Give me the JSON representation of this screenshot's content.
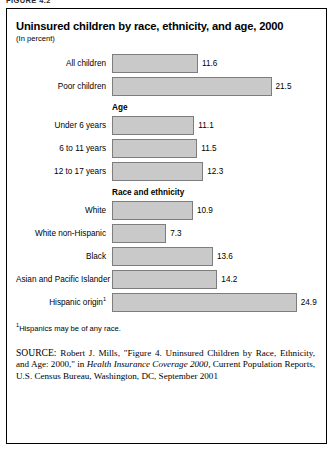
{
  "figure_tag": "FIGURE 4.2",
  "title": "Uninsured children by race, ethnicity, and age, 2000",
  "subtitle": "(In percent)",
  "footnote": {
    "marker": "1",
    "text": "Hispanics may be of any race."
  },
  "source": {
    "label": "SOURCE:",
    "part1": " Robert J. Mills, \"Figure 4. Uninsured Children by Race, Ethnicity, and Age: 2000,\" in ",
    "italic": "Health Insurance Coverage 2000,",
    "part2": " Current Population Reports, U.S. Census Bureau, Washington, DC, September 2001"
  },
  "chart_data": {
    "type": "bar",
    "orientation": "horizontal",
    "title": "Uninsured children by race, ethnicity, and age, 2000",
    "subtitle": "(In percent)",
    "xlabel": "",
    "ylabel": "",
    "xlim": [
      0,
      27
    ],
    "grid": false,
    "legend": false,
    "value_labels": true,
    "bar_color": "#c9c9c9",
    "bar_border_color": "#7d7d7d",
    "units": "percent",
    "categories": [
      "All children",
      "Poor children",
      "Under 6 years",
      "6 to 11 years",
      "12 to 17 years",
      "White",
      "White non-Hispanic",
      "Black",
      "Asian and Pacific Islander",
      "Hispanic origin"
    ],
    "values": [
      11.6,
      21.5,
      11.1,
      11.5,
      12.3,
      10.9,
      7.3,
      13.6,
      14.2,
      24.9
    ],
    "groups": [
      {
        "header": "",
        "rows": [
          {
            "label": "All children",
            "value": 11.6,
            "value_text": "11.6",
            "footnote_marker": ""
          },
          {
            "label": "Poor children",
            "value": 21.5,
            "value_text": "21.5",
            "footnote_marker": ""
          }
        ]
      },
      {
        "header": "Age",
        "rows": [
          {
            "label": "Under 6 years",
            "value": 11.1,
            "value_text": "11.1",
            "footnote_marker": ""
          },
          {
            "label": "6 to 11 years",
            "value": 11.5,
            "value_text": "11.5",
            "footnote_marker": ""
          },
          {
            "label": "12 to 17 years",
            "value": 12.3,
            "value_text": "12.3",
            "footnote_marker": ""
          }
        ]
      },
      {
        "header": "Race and ethnicity",
        "rows": [
          {
            "label": "White",
            "value": 10.9,
            "value_text": "10.9",
            "footnote_marker": ""
          },
          {
            "label": "White non-Hispanic",
            "value": 7.3,
            "value_text": "7.3",
            "footnote_marker": ""
          },
          {
            "label": "Black",
            "value": 13.6,
            "value_text": "13.6",
            "footnote_marker": ""
          },
          {
            "label": "Asian and Pacific Islander",
            "value": 14.2,
            "value_text": "14.2",
            "footnote_marker": ""
          },
          {
            "label": "Hispanic origin",
            "value": 24.9,
            "value_text": "24.9",
            "footnote_marker": "1"
          }
        ]
      }
    ]
  }
}
